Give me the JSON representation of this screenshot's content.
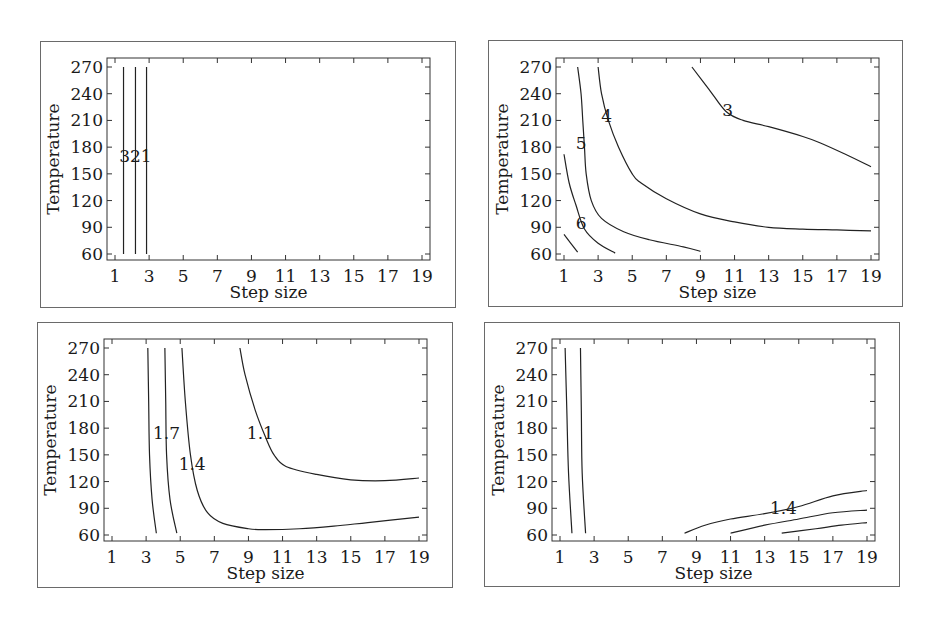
{
  "chart_data": [
    {
      "type": "contour",
      "panel": "top-left",
      "xlabel": "Step size",
      "ylabel": "Temperature",
      "xticks": [
        1,
        3,
        5,
        7,
        9,
        11,
        13,
        15,
        17,
        19
      ],
      "yticks": [
        60,
        90,
        120,
        150,
        180,
        210,
        240,
        270
      ],
      "xlim": [
        1,
        19
      ],
      "ylim": [
        60,
        270
      ],
      "contours": [
        {
          "level": "3",
          "points": [
            [
              1.5,
              60
            ],
            [
              1.5,
              270
            ]
          ]
        },
        {
          "level": "2",
          "points": [
            [
              2.2,
              60
            ],
            [
              2.2,
              270
            ]
          ]
        },
        {
          "level": "1",
          "points": [
            [
              2.85,
              60
            ],
            [
              2.85,
              270
            ]
          ]
        }
      ],
      "labels": [
        {
          "text": "321",
          "x": 2.2,
          "y": 170
        }
      ]
    },
    {
      "type": "contour",
      "panel": "top-right",
      "xlabel": "Step size",
      "ylabel": "Temperature",
      "xticks": [
        1,
        3,
        5,
        7,
        9,
        11,
        13,
        15,
        17,
        19
      ],
      "yticks": [
        60,
        90,
        120,
        150,
        180,
        210,
        240,
        270
      ],
      "xlim": [
        1,
        19
      ],
      "ylim": [
        60,
        270
      ],
      "contours": [
        {
          "level": "3",
          "points": [
            [
              8.5,
              270
            ],
            [
              9.5,
              245
            ],
            [
              10.5,
              220
            ],
            [
              11.5,
              210
            ],
            [
              13,
              203
            ],
            [
              15,
              192
            ],
            [
              16,
              185
            ],
            [
              17.5,
              172
            ],
            [
              19,
              158
            ]
          ]
        },
        {
          "level": "4",
          "points": [
            [
              3,
              270
            ],
            [
              3.2,
              240
            ],
            [
              3.6,
              210
            ],
            [
              4.2,
              180
            ],
            [
              5,
              150
            ],
            [
              5.5,
              140
            ],
            [
              7,
              122
            ],
            [
              9,
              105
            ],
            [
              11,
              96
            ],
            [
              13,
              90
            ],
            [
              15,
              88
            ],
            [
              17,
              87
            ],
            [
              19,
              86
            ]
          ]
        },
        {
          "level": "5",
          "points": [
            [
              1.8,
              270
            ],
            [
              2,
              240
            ],
            [
              2.1,
              210
            ],
            [
              2.2,
              180
            ],
            [
              2.3,
              150
            ],
            [
              2.6,
              120
            ],
            [
              3.2,
              100
            ],
            [
              4.5,
              85
            ],
            [
              6,
              76
            ],
            [
              8,
              68
            ],
            [
              9,
              63
            ]
          ]
        },
        {
          "level": "6",
          "points": [
            [
              1,
              172
            ],
            [
              1.3,
              140
            ],
            [
              1.7,
              115
            ],
            [
              2.2,
              88
            ],
            [
              3,
              72
            ],
            [
              4,
              61
            ]
          ]
        },
        {
          "level": "",
          "points": [
            [
              1,
              82
            ],
            [
              1.8,
              62
            ]
          ]
        }
      ],
      "labels": [
        {
          "text": "3",
          "x": 10.6,
          "y": 222
        },
        {
          "text": "4",
          "x": 3.5,
          "y": 215
        },
        {
          "text": "5",
          "x": 2,
          "y": 185
        },
        {
          "text": "6",
          "x": 2,
          "y": 95
        }
      ]
    },
    {
      "type": "contour",
      "panel": "bottom-left",
      "xlabel": "Step size",
      "ylabel": "Temperature",
      "xticks": [
        1,
        3,
        5,
        7,
        9,
        11,
        13,
        15,
        17,
        19
      ],
      "yticks": [
        60,
        90,
        120,
        150,
        180,
        210,
        240,
        270
      ],
      "xlim": [
        1,
        19
      ],
      "ylim": [
        60,
        270
      ],
      "contours": [
        {
          "level": "1.7",
          "points": [
            [
              3.1,
              270
            ],
            [
              3.15,
              210
            ],
            [
              3.2,
              150
            ],
            [
              3.35,
              100
            ],
            [
              3.6,
              62
            ]
          ]
        },
        {
          "level": "",
          "points": [
            [
              4.1,
              270
            ],
            [
              4.15,
              210
            ],
            [
              4.2,
              150
            ],
            [
              4.4,
              100
            ],
            [
              4.8,
              62
            ]
          ]
        },
        {
          "level": "1.4",
          "points": [
            [
              5.1,
              270
            ],
            [
              5.3,
              210
            ],
            [
              5.6,
              150
            ],
            [
              6,
              110
            ],
            [
              6.6,
              85
            ],
            [
              7.5,
              73
            ],
            [
              9,
              67
            ],
            [
              10,
              66
            ],
            [
              12,
              67
            ],
            [
              14,
              70
            ],
            [
              16,
              74
            ],
            [
              19,
              80
            ]
          ]
        },
        {
          "level": "1.1",
          "points": [
            [
              8.5,
              270
            ],
            [
              8.8,
              240
            ],
            [
              9.4,
              200
            ],
            [
              10,
              170
            ],
            [
              10.5,
              150
            ],
            [
              11.2,
              137
            ],
            [
              13,
              128
            ],
            [
              15,
              122
            ],
            [
              17,
              121
            ],
            [
              19,
              124
            ]
          ]
        }
      ],
      "labels": [
        {
          "text": "1.7",
          "x": 4.2,
          "y": 175
        },
        {
          "text": "1.4",
          "x": 5.7,
          "y": 140
        },
        {
          "text": "1.1",
          "x": 9.7,
          "y": 175
        }
      ]
    },
    {
      "type": "contour",
      "panel": "bottom-right",
      "xlabel": "Step size",
      "ylabel": "Temperature",
      "xticks": [
        1,
        3,
        5,
        7,
        9,
        11,
        13,
        15,
        17,
        19
      ],
      "yticks": [
        60,
        90,
        120,
        150,
        180,
        210,
        240,
        270
      ],
      "xlim": [
        1,
        19
      ],
      "ylim": [
        60,
        270
      ],
      "contours": [
        {
          "level": "",
          "points": [
            [
              1.3,
              270
            ],
            [
              1.4,
              200
            ],
            [
              1.5,
              130
            ],
            [
              1.7,
              62
            ]
          ]
        },
        {
          "level": "",
          "points": [
            [
              2.2,
              270
            ],
            [
              2.25,
              200
            ],
            [
              2.3,
              130
            ],
            [
              2.5,
              62
            ]
          ]
        },
        {
          "level": "1.4",
          "points": [
            [
              8.3,
              62
            ],
            [
              9.5,
              71
            ],
            [
              11,
              78
            ],
            [
              13,
              84
            ],
            [
              15,
              92
            ],
            [
              17,
              104
            ],
            [
              19,
              110
            ]
          ]
        },
        {
          "level": "",
          "points": [
            [
              11,
              62
            ],
            [
              13,
              71
            ],
            [
              15,
              78
            ],
            [
              17,
              85
            ],
            [
              19,
              88
            ]
          ]
        },
        {
          "level": "",
          "points": [
            [
              14,
              62
            ],
            [
              16,
              67
            ],
            [
              17.5,
              71
            ],
            [
              19,
              74
            ]
          ]
        }
      ],
      "labels": [
        {
          "text": "1.4",
          "x": 14.1,
          "y": 90
        }
      ]
    }
  ],
  "panels": [
    {
      "id": "p1",
      "box": [
        40,
        41,
        416,
        267
      ],
      "plot": [
        66,
        16
      ]
    },
    {
      "id": "p2",
      "box": [
        488,
        40,
        415,
        267
      ],
      "plot": [
        67,
        17
      ]
    },
    {
      "id": "p3",
      "box": [
        37,
        322,
        416,
        266
      ],
      "plot": [
        66,
        16
      ]
    },
    {
      "id": "p4",
      "box": [
        484,
        322,
        416,
        265
      ],
      "plot": [
        67,
        16
      ]
    }
  ]
}
